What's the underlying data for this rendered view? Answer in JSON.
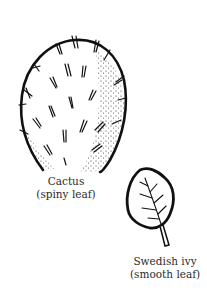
{
  "diagram": {
    "specimens": [
      {
        "name": "Cactus",
        "description": "(spiny leaf)",
        "icon": "cactus-pad-icon"
      },
      {
        "name": "Swedish ivy",
        "description": "(smooth leaf)",
        "icon": "ivy-leaf-icon"
      }
    ]
  }
}
